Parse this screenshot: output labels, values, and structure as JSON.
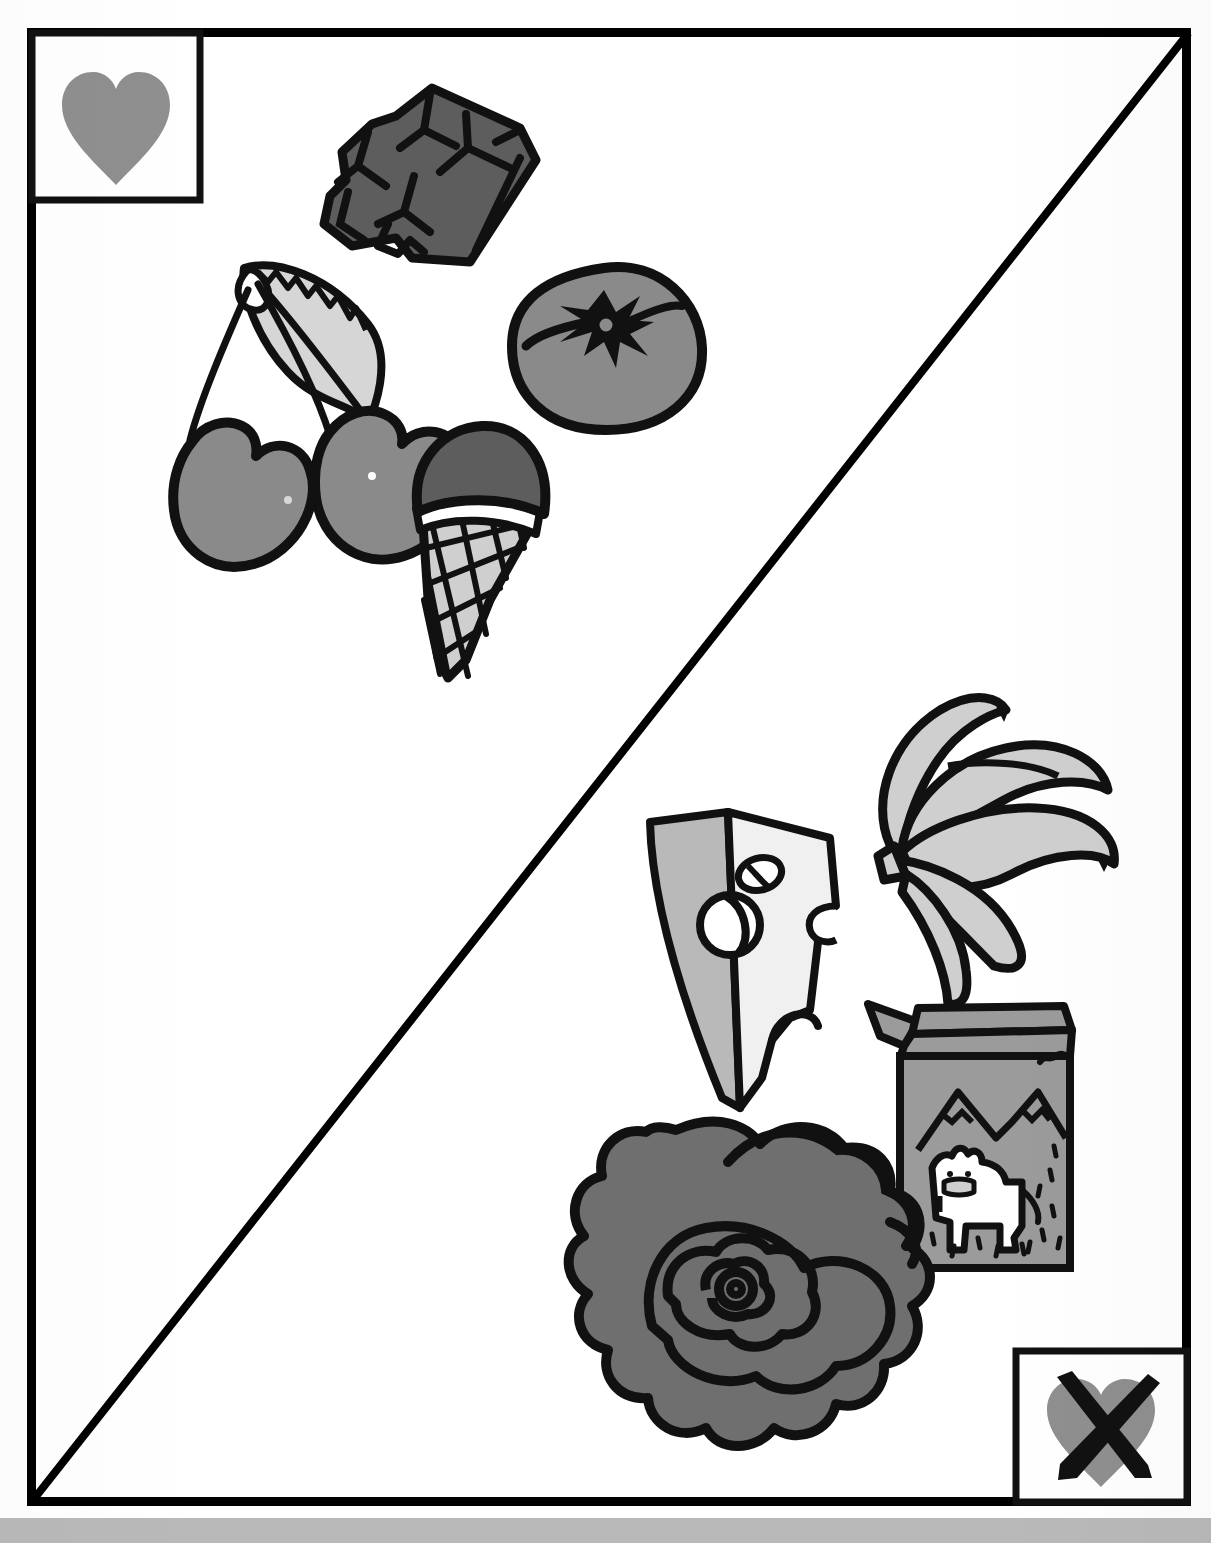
{
  "page": {
    "width": 1211,
    "height": 1543,
    "background_color": "#ffffff",
    "bottom_band_color": "#b9b9b9"
  },
  "frame": {
    "name": "worksheet-frame",
    "stroke_color": "#000000",
    "stroke_width": 9,
    "x": 27,
    "y": 28,
    "width": 1163,
    "height": 1477,
    "divider": {
      "name": "diagonal-divider",
      "description": "diagonal line from top-right corner to bottom-left corner",
      "stroke_color": "#000000",
      "stroke_width": 8
    }
  },
  "legend": {
    "like_box": {
      "label": "heart-icon",
      "meaning": "like",
      "heart_color": "#8f8f8f",
      "box_stroke": "#000000",
      "x": 27,
      "y": 28,
      "width": 173,
      "height": 172
    },
    "dislike_box": {
      "label": "crossed-out-heart-icon",
      "meaning": "dislike",
      "heart_color": "#8f8f8f",
      "cross_color": "#111111",
      "box_stroke": "#000000",
      "x": 1013,
      "y": 1348,
      "width": 177,
      "height": 157
    }
  },
  "palette": {
    "outline": "#111111",
    "dark_gray": "#5d5d5d",
    "mid_gray": "#8a8a8a",
    "light_gray": "#cfcfcf",
    "pale_gray": "#e9e9e9",
    "white": "#ffffff"
  },
  "items": {
    "upper_half": [
      {
        "name": "chocolate-bar",
        "label": "Chocolate bar",
        "fill": "#5d5d5d",
        "x": 320,
        "y": 85,
        "width": 215,
        "height": 190
      },
      {
        "name": "cherries",
        "label": "Cherries",
        "fill": "#8a8a8a",
        "leaf_fill": "#cfcfcf",
        "x": 135,
        "y": 255,
        "width": 265,
        "height": 325
      },
      {
        "name": "tomato",
        "label": "Tomato",
        "fill": "#8a8a8a",
        "x": 505,
        "y": 258,
        "width": 200,
        "height": 175
      },
      {
        "name": "ice-cream-cone",
        "label": "Ice cream cone",
        "scoop_fill": "#5d5d5d",
        "cone_fill": "#cfcfcf",
        "x": 400,
        "y": 425,
        "width": 170,
        "height": 260
      }
    ],
    "lower_half": [
      {
        "name": "cheese-wedge",
        "label": "Cheese wedge",
        "face_fill": "#efefef",
        "side_fill": "#b9b9b9",
        "x": 625,
        "y": 805,
        "width": 230,
        "height": 310
      },
      {
        "name": "bananas",
        "label": "Bananas",
        "fill": "#cfcfcf",
        "x": 860,
        "y": 695,
        "width": 255,
        "height": 285
      },
      {
        "name": "milk-carton",
        "label": "Milk carton",
        "fill": "#9b9b9b",
        "cow_fill": "#ffffff",
        "x": 865,
        "y": 995,
        "width": 215,
        "height": 285
      },
      {
        "name": "lettuce",
        "label": "Lettuce",
        "fill": "#6f6f6f",
        "x": 545,
        "y": 1115,
        "width": 335,
        "height": 345
      }
    ]
  }
}
